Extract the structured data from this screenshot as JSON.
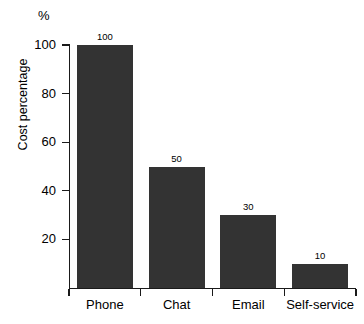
{
  "chart_data": {
    "type": "bar",
    "title": "",
    "subtitle": "",
    "xlabel": "",
    "ylabel": "Cost percentage",
    "unit_label": "%",
    "categories": [
      "Phone",
      "Chat",
      "Email",
      "Self-service"
    ],
    "values": [
      100,
      50,
      30,
      10
    ],
    "value_labels": [
      "100",
      "50",
      "30",
      "10"
    ],
    "ylim": [
      0,
      100
    ],
    "yticks": [
      20,
      40,
      60,
      80,
      100
    ],
    "ytick_labels": [
      "20",
      "40",
      "60",
      "80",
      "100"
    ],
    "grid": false,
    "legend": null,
    "legend_position": "none",
    "series": [
      {
        "name": "Cost percentage",
        "values": [
          100,
          50,
          30,
          10
        ],
        "color": "#333333"
      }
    ],
    "annotations": []
  },
  "style": {
    "bar_color": "#333333",
    "axis_color": "#1a1a1a",
    "background": "#ffffff",
    "text_color": "#000000"
  }
}
